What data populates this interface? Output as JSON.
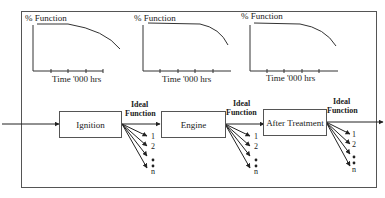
{
  "diagram": {
    "charts": [
      {
        "ylabel": "% Function",
        "xlabel": "Time '000 hrs"
      },
      {
        "ylabel": "% Function",
        "xlabel": "Time '000 hrs"
      },
      {
        "ylabel": "% Function",
        "xlabel": "Time '000 hrs"
      }
    ],
    "blocks": [
      {
        "label": "Ignition"
      },
      {
        "label": "Engine"
      },
      {
        "label": "After Treatment"
      }
    ],
    "outputs": [
      {
        "title_line1": "Ideal",
        "title_line2": "Function",
        "items": [
          "1",
          "2",
          "n"
        ]
      },
      {
        "title_line1": "Ideal",
        "title_line2": "Function",
        "items": [
          "1",
          "2",
          "n"
        ]
      },
      {
        "title_line1": "Ideal",
        "title_line2": "Function",
        "items": [
          "1",
          "2",
          "n"
        ]
      }
    ]
  }
}
